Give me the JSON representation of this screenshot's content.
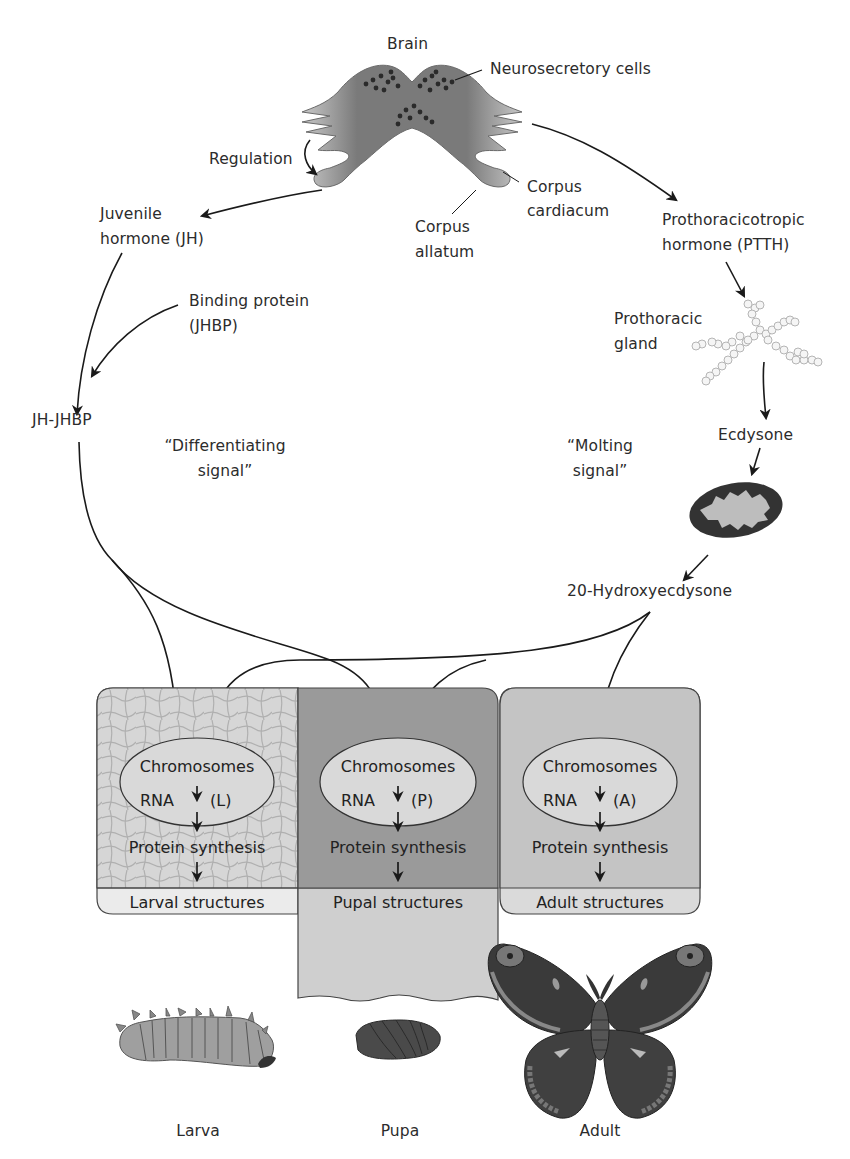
{
  "diagram": {
    "top": {
      "brain": "Brain",
      "neurosecretory_cells": "Neurosecretory cells",
      "regulation": "Regulation",
      "corpus_cardiacum_1": "Corpus",
      "corpus_cardiacum_2": "cardiacum",
      "corpus_allatum_1": "Corpus",
      "corpus_allatum_2": "allatum"
    },
    "left_pathway": {
      "juvenile_hormone_1": "Juvenile",
      "juvenile_hormone_2": "hormone (JH)",
      "binding_protein_1": "Binding protein",
      "binding_protein_2": "(JHBP)",
      "complex": "JH-JHBP",
      "signal_1": "“Differentiating",
      "signal_2": "signal”"
    },
    "right_pathway": {
      "ptth_1": "Prothoracicotropic",
      "ptth_2": "hormone (PTTH)",
      "gland_1": "Prothoracic",
      "gland_2": "gland",
      "ecdysone": "Ecdysone",
      "signal_1": "“Molting",
      "signal_2": "signal”",
      "hydroxyecdysone": "20-Hydroxyecdysone"
    },
    "cells": [
      {
        "id": "larval",
        "chromosomes": "Chromosomes",
        "rna": "RNA",
        "code": "(L)",
        "protein": "Protein synthesis",
        "structures": "Larval structures",
        "fill": "#d6d6d6"
      },
      {
        "id": "pupal",
        "chromosomes": "Chromosomes",
        "rna": "RNA",
        "code": "(P)",
        "protein": "Protein synthesis",
        "structures": "Pupal structures",
        "fill": "#9a9a9a"
      },
      {
        "id": "adult",
        "chromosomes": "Chromosomes",
        "rna": "RNA",
        "code": "(A)",
        "protein": "Protein synthesis",
        "structures": "Adult structures",
        "fill": "#c4c4c4"
      }
    ],
    "stages": [
      {
        "label": "Larva"
      },
      {
        "label": "Pupa"
      },
      {
        "label": "Adult"
      }
    ],
    "colors": {
      "brain": "#7a7a7a",
      "arrow": "#1a1a1a",
      "nucleus": "#d9d9d9",
      "pupal_cell": "#9a9a9a",
      "larval_cell": "#d6d6d6",
      "adult_cell": "#c4c4c4"
    }
  }
}
